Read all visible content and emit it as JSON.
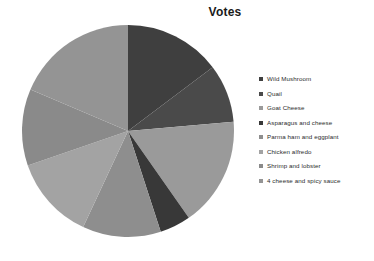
{
  "chart_data": {
    "type": "pie",
    "title": "Votes",
    "categories": [
      "Wild Mushroom",
      "Quail",
      "Goat Cheese",
      "Asparagus and cheese",
      "Parma ham and eggplant",
      "Chicken alfredo",
      "Shrimp and lobster",
      "4 cheese and spicy sauce"
    ],
    "values": [
      53,
      32,
      60,
      17,
      43,
      46,
      42,
      67
    ],
    "unit": "degrees",
    "start_angle": 0,
    "direction": "clockwise",
    "colors": [
      "#3f3f3f",
      "#4a4a4a",
      "#9a9a9a",
      "#383838",
      "#8e8e8e",
      "#a3a3a3",
      "#8a8a8a",
      "#949494"
    ],
    "legend_position": "right",
    "grid": false,
    "xlabel": "",
    "ylabel": ""
  },
  "chart": {
    "title": "Votes"
  },
  "legend": {
    "items": [
      {
        "label": "Wild Mushroom",
        "color": "#3f3f3f"
      },
      {
        "label": "Quail",
        "color": "#4a4a4a"
      },
      {
        "label": "Goat Cheese",
        "color": "#9a9a9a"
      },
      {
        "label": "Asparagus and cheese",
        "color": "#383838"
      },
      {
        "label": "Parma ham and eggplant",
        "color": "#8e8e8e"
      },
      {
        "label": "Chicken alfredo",
        "color": "#a3a3a3"
      },
      {
        "label": "Shrimp and lobster",
        "color": "#8a8a8a"
      },
      {
        "label": "4 cheese and spicy sauce",
        "color": "#949494"
      }
    ]
  }
}
